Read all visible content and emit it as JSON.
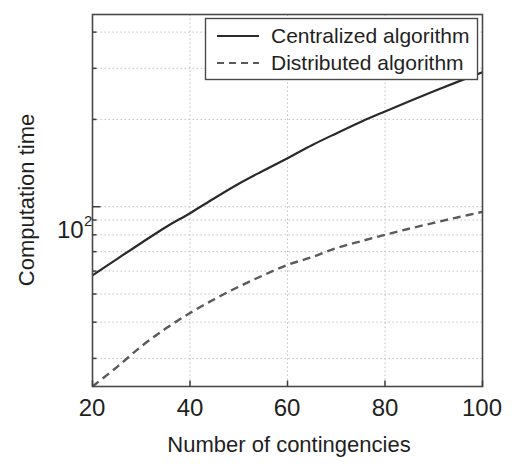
{
  "figure": {
    "background": "#ffffff",
    "plot_border_color": "#4a4a4a",
    "grid_color": "#bdbdbd"
  },
  "axes": {
    "x_title": "Number of contingencies",
    "y_title": "Computation time",
    "x_ticks": [
      "20",
      "40",
      "60",
      "80",
      "100"
    ],
    "y_tick_base": "10",
    "y_tick_exponent": "2"
  },
  "legend": {
    "items": [
      {
        "label": "Centralized algorithm",
        "style": "solid",
        "color": "#2a2a2a"
      },
      {
        "label": "Distributed algorithm",
        "style": "dashed",
        "color": "#5a5a5a"
      }
    ]
  },
  "chart_data": {
    "type": "line",
    "title": "",
    "xlabel": "Number of contingencies",
    "ylabel": "Computation time",
    "xlim": [
      20,
      100
    ],
    "ylim": [
      24,
      460
    ],
    "xscale": "linear",
    "yscale": "log",
    "grid": true,
    "legend_position": "top-right",
    "x_ticks": [
      20,
      40,
      60,
      80,
      100
    ],
    "y_ticks": [
      100
    ],
    "y_tick_labels": [
      "10^2"
    ],
    "y_minor_ticks": [
      30,
      40,
      50,
      60,
      70,
      80,
      90,
      200,
      300,
      400
    ],
    "x": [
      20,
      25,
      30,
      35,
      40,
      45,
      50,
      55,
      60,
      65,
      70,
      75,
      80,
      85,
      90,
      95,
      100
    ],
    "series": [
      {
        "name": "Centralized algorithm",
        "style": "solid",
        "color": "#2a2a2a",
        "values": [
          58,
          66,
          75,
          85,
          95,
          107,
          120,
          133,
          147,
          163,
          179,
          196,
          213,
          231,
          250,
          270,
          291
        ]
      },
      {
        "name": "Distributed algorithm",
        "style": "dashed",
        "color": "#5a5a5a",
        "values": [
          24,
          28,
          33,
          38,
          43,
          48,
          53,
          58,
          63,
          67,
          72,
          76,
          80,
          84,
          88,
          92,
          96
        ]
      }
    ]
  }
}
